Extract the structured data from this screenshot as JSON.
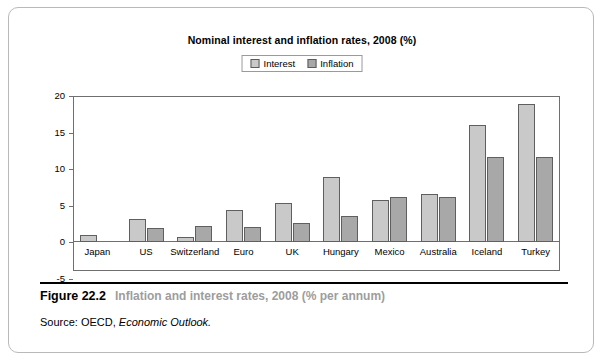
{
  "figure": {
    "number": "Figure 22.2",
    "caption": "Inflation and interest rates, 2008 (% per annum)",
    "source_label": "Source: OECD, ",
    "source_italic": "Economic Outlook."
  },
  "legend": {
    "interest_label": "Interest",
    "inflation_label": "Inflation",
    "interest_color": "#c9c9c9",
    "inflation_color": "#a8a8a8"
  },
  "axis": {
    "yticks": [
      "20",
      "15",
      "10",
      "5",
      "0",
      "-5"
    ]
  },
  "chart_data": {
    "type": "bar",
    "title": "Nominal interest and inflation rates, 2008 (%)",
    "xlabel": "",
    "ylabel": "",
    "ylim": [
      -5,
      20
    ],
    "yticks": [
      -5,
      0,
      5,
      10,
      15,
      20
    ],
    "grid": false,
    "legend_position": "top-center",
    "categories": [
      "Japan",
      "US",
      "Switzerland",
      "Euro",
      "UK",
      "Hungary",
      "Mexico",
      "Australia",
      "Iceland",
      "Turkey"
    ],
    "series": [
      {
        "name": "Interest",
        "color": "#c9c9c9",
        "values": [
          0.9,
          3.1,
          0.7,
          4.4,
          5.3,
          8.9,
          5.8,
          6.6,
          16.0,
          18.9
        ]
      },
      {
        "name": "Inflation",
        "color": "#a8a8a8",
        "values": [
          0.0,
          1.9,
          2.2,
          2.1,
          2.6,
          3.6,
          6.2,
          6.1,
          11.7,
          11.7
        ]
      }
    ]
  }
}
